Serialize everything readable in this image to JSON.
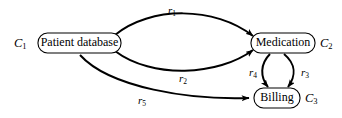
{
  "diagram": {
    "background_color": "#ffffff",
    "line_color": "#000000",
    "nodes": [
      {
        "id": "patient-database",
        "label": "Patient database",
        "class_label": "C",
        "class_sub": "1",
        "class_side": "left"
      },
      {
        "id": "medication",
        "label": "Medication",
        "class_label": "C",
        "class_sub": "2",
        "class_side": "right"
      },
      {
        "id": "billing",
        "label": "Billing",
        "class_label": "C",
        "class_sub": "3",
        "class_side": "right"
      }
    ],
    "edges": [
      {
        "id": "r1",
        "label": "r",
        "sub": "1",
        "from": "patient-database",
        "to": "medication",
        "curve": "upper"
      },
      {
        "id": "r2",
        "label": "r",
        "sub": "2",
        "from": "patient-database",
        "to": "medication",
        "curve": "lower"
      },
      {
        "id": "r3",
        "label": "r",
        "sub": "3",
        "from": "medication",
        "to": "billing",
        "curve": "right"
      },
      {
        "id": "r4",
        "label": "r",
        "sub": "4",
        "from": "medication",
        "to": "billing",
        "curve": "left"
      },
      {
        "id": "r5",
        "label": "r",
        "sub": "5",
        "from": "patient-database",
        "to": "billing",
        "curve": "lower-long"
      }
    ]
  }
}
